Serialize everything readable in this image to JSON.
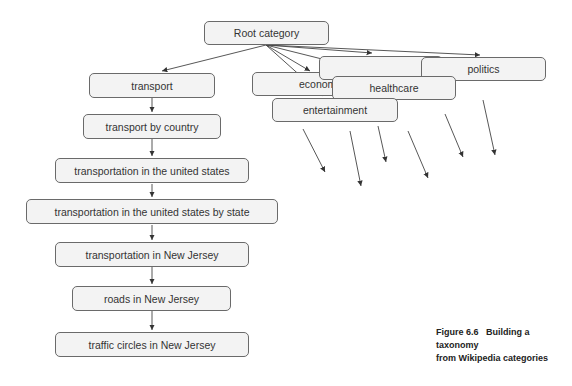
{
  "diagram": {
    "root": "Root category",
    "top_categories": [
      "transport",
      "economy",
      "healthcare",
      "entertainment",
      "politics"
    ],
    "hidden_category_label": "",
    "transport_chain": [
      "transport",
      "transport by country",
      "transportation in the united states",
      "transportation in the united states by state",
      "transportation in New Jersey",
      "roads in New Jersey",
      "traffic circles in New Jersey"
    ],
    "economy_partial_label": "econom"
  },
  "caption": {
    "figure": "Figure 6.6",
    "text_line1": "Building a taxonomy",
    "text_line2": "from Wikipedia categories"
  }
}
